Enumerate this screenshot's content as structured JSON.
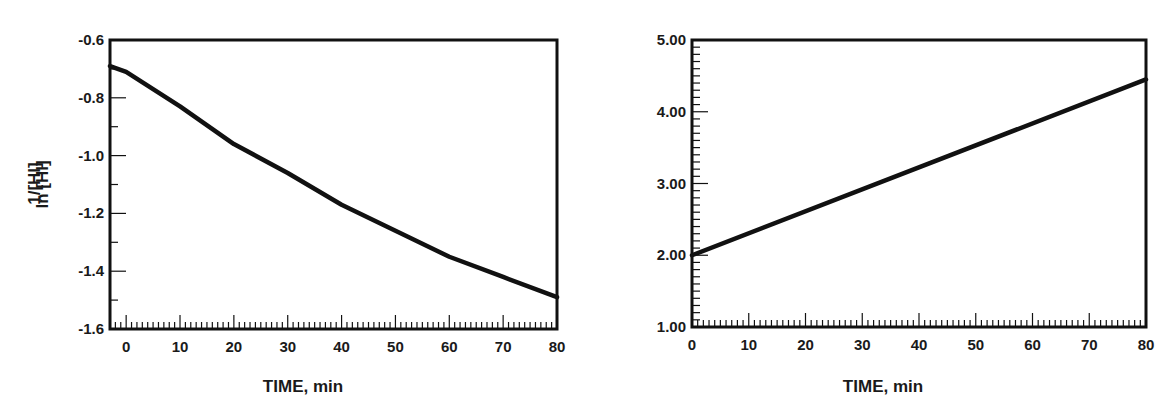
{
  "chart_data": [
    {
      "type": "line",
      "title": "",
      "xlabel": "TIME, min",
      "ylabel": "ln [HI]",
      "xlim": [
        -3,
        80
      ],
      "ylim": [
        -1.6,
        -0.6
      ],
      "grid": false,
      "x_ticks": [
        0,
        10,
        20,
        30,
        40,
        50,
        60,
        70,
        80
      ],
      "x_tick_labels": [
        "0",
        "10",
        "20",
        "30",
        "40",
        "50",
        "60",
        "70",
        "80"
      ],
      "y_ticks": [
        -0.6,
        -0.8,
        -1.0,
        -1.2,
        -1.4,
        -1.6
      ],
      "y_tick_labels": [
        "-0.6",
        "-0.8",
        "-1.0",
        "-1.2",
        "-1.4",
        "-1.6"
      ],
      "series": [
        {
          "name": "ln [HI]",
          "x": [
            -3,
            0,
            10,
            20,
            30,
            40,
            50,
            60,
            70,
            80
          ],
          "values": [
            -0.69,
            -0.71,
            -0.83,
            -0.96,
            -1.06,
            -1.17,
            -1.26,
            -1.35,
            -1.42,
            -1.49
          ]
        }
      ]
    },
    {
      "type": "line",
      "title": "",
      "xlabel": "TIME, min",
      "ylabel": "1/[HI]",
      "xlim": [
        0,
        80
      ],
      "ylim": [
        1.0,
        5.0
      ],
      "grid": false,
      "x_ticks": [
        0,
        10,
        20,
        30,
        40,
        50,
        60,
        70,
        80
      ],
      "x_tick_labels": [
        "0",
        "10",
        "20",
        "30",
        "40",
        "50",
        "60",
        "70",
        "80"
      ],
      "y_ticks": [
        1.0,
        2.0,
        3.0,
        4.0,
        5.0
      ],
      "y_tick_labels": [
        "1.00",
        "2.00",
        "3.00",
        "4.00",
        "5.00"
      ],
      "series": [
        {
          "name": "1/[HI]",
          "x": [
            0,
            80
          ],
          "values": [
            2.0,
            4.45
          ]
        }
      ]
    }
  ],
  "left": {
    "ylabel": "ln [HI]",
    "xlabel": "TIME, min"
  },
  "right": {
    "ylabel": "1/[HI]",
    "xlabel": "TIME, min"
  },
  "colors": {
    "line": "#111111",
    "axis": "#111111",
    "background": "#ffffff"
  }
}
